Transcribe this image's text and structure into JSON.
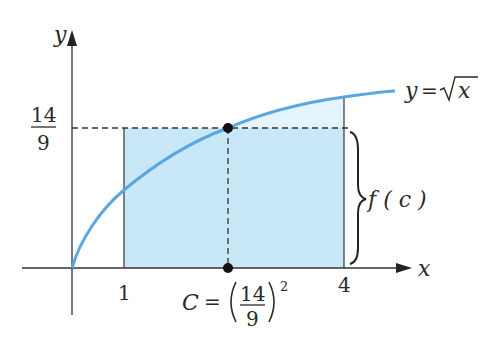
{
  "diagram": {
    "function_label": "y = √x",
    "function_label_parts": {
      "lhs": "y",
      "eq": "=",
      "radical": "√",
      "arg": "x"
    },
    "axes": {
      "x_label": "x",
      "y_label": "y"
    },
    "x_ticks": [
      "1",
      "4"
    ],
    "y_tick": {
      "numerator": "14",
      "denominator": "9"
    },
    "brace_label": "f ( c )",
    "c_label": {
      "lhs": "C",
      "eq": "=",
      "numerator": "14",
      "denominator": "9",
      "exponent": "2"
    },
    "colors": {
      "curve": "#5aa6e0",
      "rect_fill": "#c8e8f7",
      "excess_fill": "#e4f4fc",
      "axis": "#333333",
      "point": "#111111"
    }
  }
}
